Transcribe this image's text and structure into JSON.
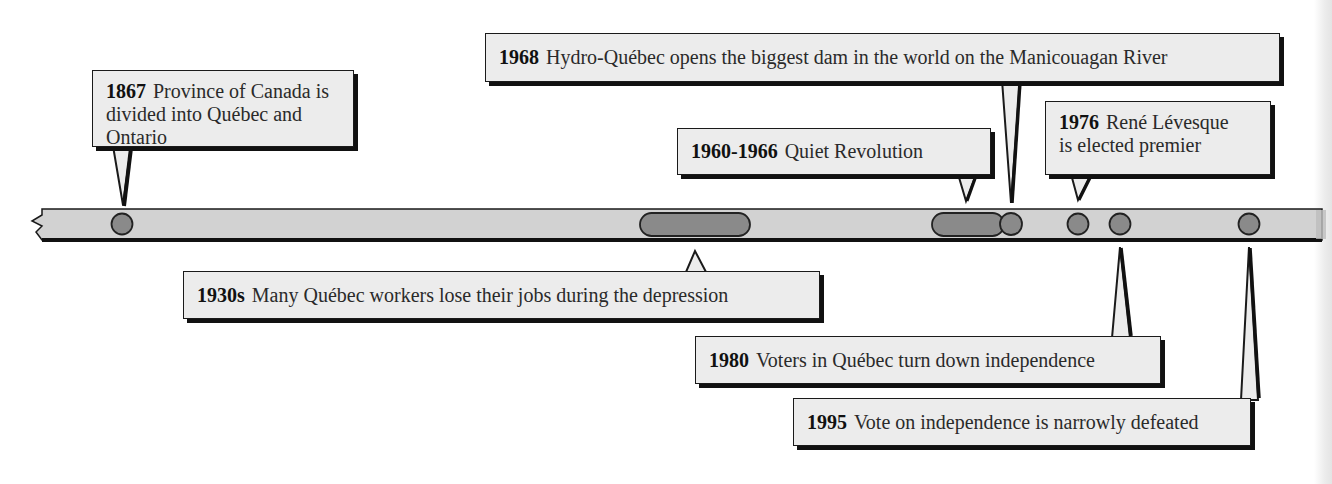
{
  "timeline": {
    "colors": {
      "bar_fill": "#d2d2d2",
      "bar_outline": "#1a1a1a",
      "marker_fill": "#8a8a8a",
      "marker_outline": "#222222",
      "callout_fill": "#ececec",
      "callout_shadow": "#111111"
    },
    "events": [
      {
        "id": "1867",
        "year": "1867",
        "text": "Province of Canada is divided into Québec and Ontario",
        "line1_rest": "Province of Canada is",
        "line2": "divided into Québec and Ontario",
        "marker": "dot",
        "position": "above"
      },
      {
        "id": "1930s",
        "year": "1930s",
        "text": "Many Québec workers lose their jobs during the depression",
        "marker": "span",
        "position": "below"
      },
      {
        "id": "1960-1966",
        "year": "1960-1966",
        "text": "Quiet Revolution",
        "marker": "span",
        "position": "above"
      },
      {
        "id": "1968",
        "year": "1968",
        "text": "Hydro-Québec opens the biggest dam in the world on the Manicouagan River",
        "marker": "dot",
        "position": "above"
      },
      {
        "id": "1976",
        "year": "1976",
        "text": "René Lévesque is elected premier",
        "line1_rest": "René Lévesque",
        "line2": "is elected premier",
        "marker": "dot",
        "position": "above"
      },
      {
        "id": "1980",
        "year": "1980",
        "text": "Voters in Québec turn down independence",
        "marker": "dot",
        "position": "below"
      },
      {
        "id": "1995",
        "year": "1995",
        "text": "Vote on independence is narrowly defeated",
        "marker": "dot",
        "position": "below"
      }
    ]
  }
}
